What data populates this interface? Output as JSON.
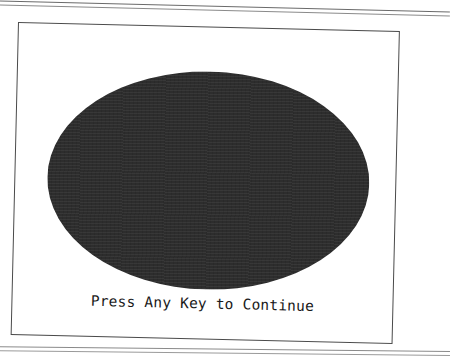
{
  "screen": {
    "prompt_text": "Press Any Key to Continue",
    "shape": {
      "type": "ellipse",
      "fill_color": "#2d2d2d",
      "background_color": "#ffffff"
    },
    "frame_color": "#4a4a4a"
  }
}
